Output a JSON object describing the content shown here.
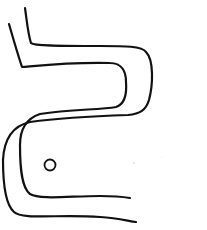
{
  "figure": {
    "width": 207,
    "height": 230,
    "background": "#ffffff",
    "stroke_color": "#111111",
    "stroke_width": 2.2,
    "paths": {
      "outer_line": "M25,8 C27,22 28,34 31,43 C34,46 60,46 100,46 C125,46 142,46 146,52 C154,60 153,85 149,100 C146,110 140,114 128,115 C100,116 60,118 30,122 C12,126 4,140 3,160 C3,185 6,205 14,212 C22,220 60,214 100,217 C118,218 128,221 136,222",
      "inner_line": "M9,24 C13,38 18,55 22,67 C35,66 70,62 110,63 C122,63 126,72 126,82 C127,95 125,104 116,107 C100,110 70,109 40,114 C28,118 20,128 20,145 C20,170 22,188 30,194 C40,200 70,196 100,196 C115,196 124,197 130,198"
    },
    "eye": {
      "cx": 50,
      "cy": 165,
      "r": 5.5
    },
    "specks": [
      {
        "cx": 134,
        "cy": 163,
        "r": 0.6
      },
      {
        "cx": 162,
        "cy": 157,
        "r": 0.4
      }
    ]
  }
}
